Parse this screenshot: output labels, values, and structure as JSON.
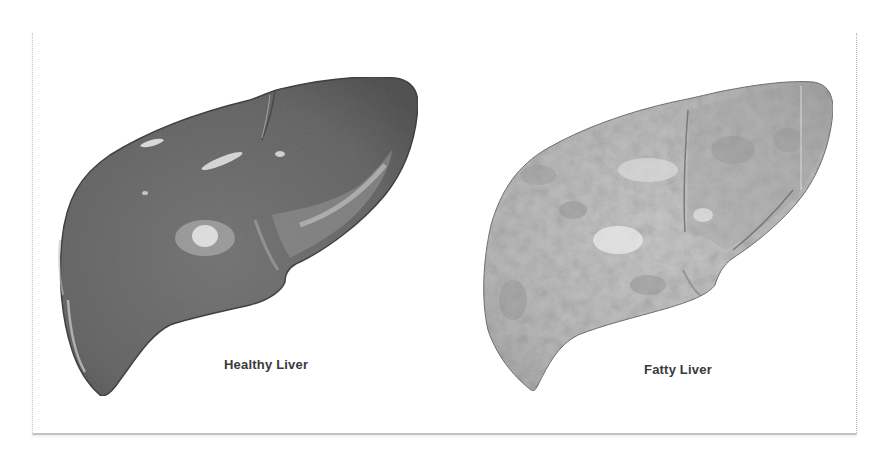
{
  "figure": {
    "panels": [
      {
        "label": "Healthy Liver",
        "fill": "#6f6f6f",
        "shade": "#5a5a5a",
        "highlight": "#d8d8d8"
      },
      {
        "label": "Fatty Liver",
        "fill": "#b9b9b9",
        "shade": "#9a9a9a",
        "highlight": "#e6e6e6"
      }
    ],
    "colors": {
      "background": "#ffffff",
      "frame": "#c4c4c4",
      "label": "#3a3a3a"
    }
  }
}
